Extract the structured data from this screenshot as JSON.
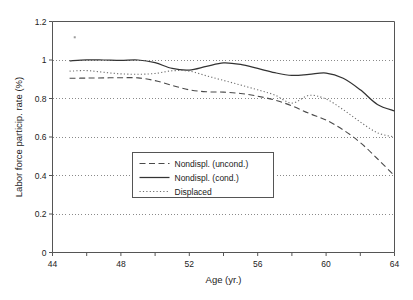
{
  "chart_data": {
    "type": "line",
    "title": "",
    "xlabel": "Age (yr.)",
    "ylabel": "Labor force particip. rate (%)",
    "xlim": [
      44,
      64
    ],
    "ylim": [
      0,
      1.2
    ],
    "xticks": [
      44,
      46,
      48,
      50,
      52,
      54,
      56,
      58,
      60,
      62,
      64
    ],
    "xtick_labels": [
      "44",
      "",
      "48",
      "",
      "52",
      "",
      "56",
      "",
      "60",
      "",
      "64"
    ],
    "yticks": [
      0,
      0.2,
      0.4,
      0.6,
      0.8,
      1,
      1.2
    ],
    "ytick_labels": [
      "0",
      "0.2",
      "0.4",
      "0.6",
      "0.8",
      "1",
      "1.2"
    ],
    "grid": "horizontal-dotted",
    "legend_position": "center-left",
    "x": [
      45,
      46,
      47,
      48,
      49,
      50,
      51,
      52,
      53,
      54,
      55,
      56,
      57,
      58,
      59,
      60,
      61,
      62,
      63,
      64
    ],
    "series": [
      {
        "name": "Nondispl. (uncond.)",
        "style": "dashed",
        "color": "#4a4a4a",
        "values": [
          0.905,
          0.906,
          0.907,
          0.908,
          0.907,
          0.893,
          0.868,
          0.845,
          0.835,
          0.833,
          0.826,
          0.812,
          0.792,
          0.762,
          0.723,
          0.688,
          0.637,
          0.571,
          0.487,
          0.399
        ]
      },
      {
        "name": "Nondispl. (cond.)",
        "style": "solid",
        "color": "#333333",
        "values": [
          0.995,
          1.001,
          1.0,
          0.998,
          1.0,
          0.986,
          0.956,
          0.948,
          0.967,
          0.985,
          0.977,
          0.956,
          0.934,
          0.92,
          0.925,
          0.932,
          0.905,
          0.845,
          0.769,
          0.735
        ]
      },
      {
        "name": "Displaced",
        "style": "dotted",
        "color": "#6e6e6e",
        "values": [
          0.942,
          0.945,
          0.936,
          0.928,
          0.926,
          0.93,
          0.944,
          0.942,
          0.918,
          0.894,
          0.87,
          0.845,
          0.818,
          0.776,
          0.816,
          0.797,
          0.742,
          0.678,
          0.622,
          0.6
        ]
      }
    ],
    "annotations": [
      {
        "name": "stray-marker",
        "x": 45.3,
        "y": 1.118
      }
    ]
  },
  "legend": {
    "entries": [
      {
        "label": "Nondispl. (uncond.)"
      },
      {
        "label": "Nondispl. (cond.)"
      },
      {
        "label": "Displaced"
      }
    ]
  }
}
